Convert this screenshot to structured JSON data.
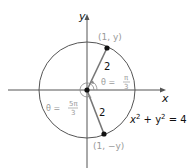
{
  "diagram": {
    "title": "",
    "axes": {
      "x_label": "x",
      "y_label": "y"
    },
    "circle": {
      "equation_lhs": "x",
      "equation_mid": " + y",
      "equation_rhs": " = 4",
      "exponent": "2",
      "radius": 2
    },
    "points": {
      "upper": "(1, y)",
      "lower": "(1, −y)"
    },
    "segments": {
      "upper_length": "2",
      "lower_length": "2"
    },
    "angles": {
      "upper_theta": "θ =",
      "upper_num": "π",
      "upper_den": "3",
      "lower_theta": "θ =",
      "lower_num": "5π",
      "lower_den": "3"
    },
    "colors": {
      "line": "#555555",
      "label_gray": "#9a9a9a",
      "point": "#111111"
    }
  }
}
